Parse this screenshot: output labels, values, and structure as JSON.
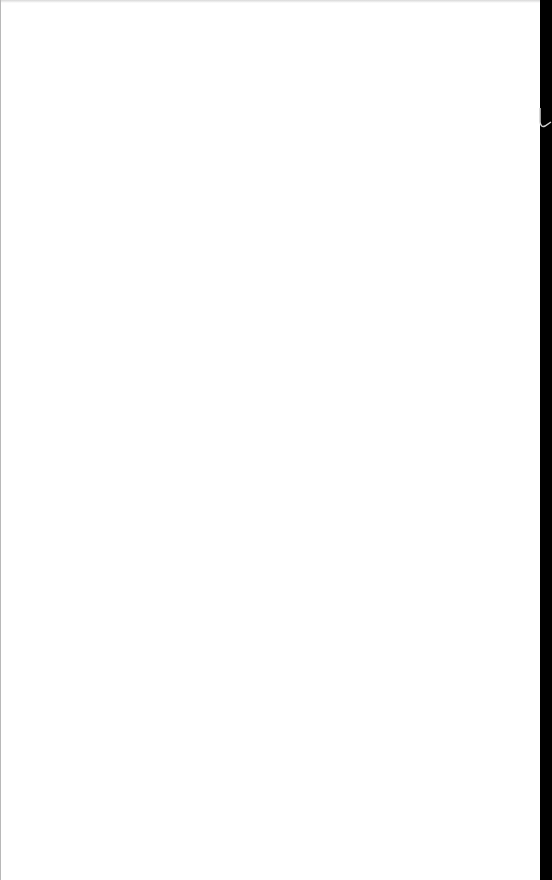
{
  "page": {
    "background": "#ffffff",
    "content": ""
  },
  "right_strip": {
    "color": "#000000"
  }
}
